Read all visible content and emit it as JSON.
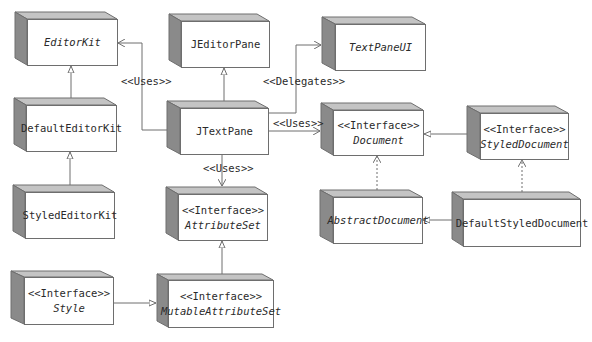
{
  "diagram": {
    "type": "UML class diagram",
    "colors": {
      "box_fill": "#ffffff",
      "box_stroke": "#6e6e6e",
      "box_side": "#8a8a8a",
      "box_top": "#bdbdbd",
      "line": "#6e6e6e",
      "text": "#2a2a2a"
    },
    "nodes": {
      "editorkit": {
        "stereotype": "",
        "name": "EditorKit",
        "italic": true
      },
      "jeditorpane": {
        "stereotype": "",
        "name": "JEditorPane",
        "italic": false
      },
      "textpaneui": {
        "stereotype": "",
        "name": "TextPaneUI",
        "italic": true
      },
      "defaulteditorkit": {
        "stereotype": "",
        "name": "DefaultEditorKit",
        "italic": false
      },
      "jtextpane": {
        "stereotype": "",
        "name": "JTextPane",
        "italic": false
      },
      "document": {
        "stereotype": "<<Interface>>",
        "name": "Document",
        "italic": true
      },
      "styleddocument": {
        "stereotype": "<<Interface>>",
        "name": "StyledDocument",
        "italic": true
      },
      "stylededitorkit": {
        "stereotype": "",
        "name": "StyledEditorKit",
        "italic": false
      },
      "attributeset": {
        "stereotype": "<<Interface>>",
        "name": "AttributeSet",
        "italic": true
      },
      "abstractdocument": {
        "stereotype": "",
        "name": "AbstractDocument",
        "italic": true
      },
      "defaultstyleddocument": {
        "stereotype": "",
        "name": "DefaultStyledDocument",
        "italic": false
      },
      "style": {
        "stereotype": "<<Interface>>",
        "name": "Style",
        "italic": true
      },
      "mutableattributeset": {
        "stereotype": "<<Interface>>",
        "name": "MutableAttributeSet",
        "italic": true
      }
    },
    "edges": [
      {
        "from": "JTextPane",
        "to": "EditorKit",
        "kind": "dependency",
        "label": "<<Uses>>"
      },
      {
        "from": "JTextPane",
        "to": "JEditorPane",
        "kind": "generalization",
        "label": ""
      },
      {
        "from": "JTextPane",
        "to": "TextPaneUI",
        "kind": "dependency",
        "label": "<<Delegates>>"
      },
      {
        "from": "JTextPane",
        "to": "Document",
        "kind": "dependency",
        "label": "<<Uses>>"
      },
      {
        "from": "JTextPane",
        "to": "AttributeSet",
        "kind": "dependency",
        "label": "<<Uses>>"
      },
      {
        "from": "DefaultEditorKit",
        "to": "EditorKit",
        "kind": "generalization",
        "label": ""
      },
      {
        "from": "StyledEditorKit",
        "to": "DefaultEditorKit",
        "kind": "generalization",
        "label": ""
      },
      {
        "from": "StyledDocument",
        "to": "Document",
        "kind": "generalization",
        "label": ""
      },
      {
        "from": "AbstractDocument",
        "to": "Document",
        "kind": "realization",
        "label": ""
      },
      {
        "from": "DefaultStyledDocument",
        "to": "StyledDocument",
        "kind": "realization",
        "label": ""
      },
      {
        "from": "DefaultStyledDocument",
        "to": "AbstractDocument",
        "kind": "generalization",
        "label": ""
      },
      {
        "from": "MutableAttributeSet",
        "to": "AttributeSet",
        "kind": "generalization",
        "label": ""
      },
      {
        "from": "Style",
        "to": "MutableAttributeSet",
        "kind": "generalization",
        "label": ""
      }
    ],
    "edge_labels": {
      "uses_editorkit": "<<Uses>>",
      "delegates": "<<Delegates>>",
      "uses_document": "<<Uses>>",
      "uses_attributeset": "<<Uses>>"
    }
  }
}
